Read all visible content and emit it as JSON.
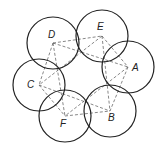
{
  "diagram": {
    "type": "overlapping-circles-graph",
    "nodes": [
      {
        "id": "D",
        "label": "D",
        "cx": 53,
        "cy": 43,
        "r": 26,
        "lx": 48,
        "ly": 38
      },
      {
        "id": "E",
        "label": "E",
        "cx": 102,
        "cy": 36,
        "r": 26,
        "lx": 97,
        "ly": 30
      },
      {
        "id": "A",
        "label": "A",
        "cx": 128,
        "cy": 67,
        "r": 26,
        "lx": 132,
        "ly": 71
      },
      {
        "id": "B",
        "label": "B",
        "cx": 110,
        "cy": 111,
        "r": 26,
        "lx": 108,
        "ly": 121
      },
      {
        "id": "C",
        "label": "C",
        "cx": 39,
        "cy": 85,
        "r": 26,
        "lx": 27,
        "ly": 88
      },
      {
        "id": "F",
        "label": "F",
        "cx": 65,
        "cy": 116,
        "r": 26,
        "lx": 60,
        "ly": 127
      }
    ],
    "edges": [
      [
        "D",
        "E"
      ],
      [
        "D",
        "A"
      ],
      [
        "D",
        "C"
      ],
      [
        "D",
        "F"
      ],
      [
        "E",
        "A"
      ],
      [
        "E",
        "C"
      ],
      [
        "E",
        "B"
      ],
      [
        "A",
        "B"
      ],
      [
        "A",
        "F"
      ],
      [
        "C",
        "F"
      ],
      [
        "C",
        "B"
      ],
      [
        "F",
        "B"
      ]
    ],
    "colors": {
      "circle": "#222222",
      "edge": "#555555",
      "background": "#ffffff"
    }
  }
}
